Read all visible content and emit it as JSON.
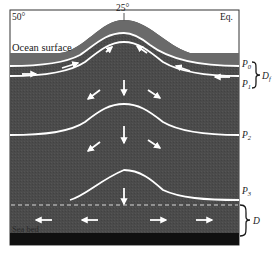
{
  "diagram": {
    "top_labels": {
      "left_latitude": "50°",
      "center_latitude": "25°",
      "right_latitude": "Eq."
    },
    "regions": {
      "surface": "Ocean surface",
      "bottom": "Sea bed"
    },
    "isopycnals": [
      {
        "id": "P0",
        "label": "P",
        "sub": "0"
      },
      {
        "id": "P1",
        "label": "P",
        "sub": "1"
      },
      {
        "id": "P2",
        "label": "P",
        "sub": "2"
      },
      {
        "id": "P3",
        "label": "P",
        "sub": "3"
      }
    ],
    "braces": [
      {
        "id": "Df",
        "label": "D",
        "sub": "f",
        "spans": "P0–P1"
      },
      {
        "id": "D",
        "label": "D",
        "sub": "",
        "spans": "dashed line–sea bed"
      }
    ],
    "colors": {
      "water_dark": "#4a4a4a",
      "surface_band": "#6e6e6e",
      "seabed": "#111111",
      "lines": "#ffffff",
      "sky": "#ffffff",
      "frame": "#333333"
    }
  }
}
